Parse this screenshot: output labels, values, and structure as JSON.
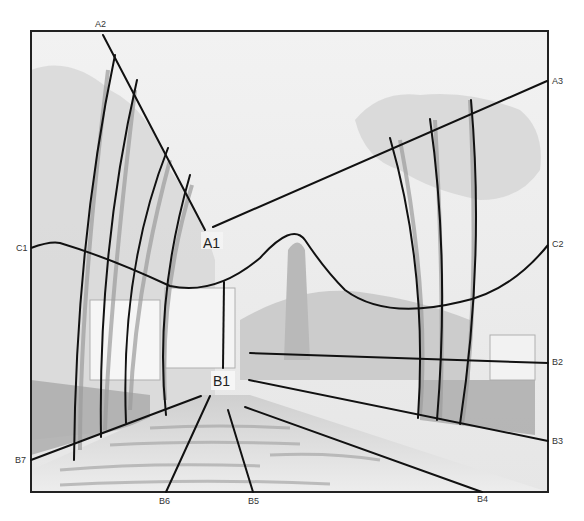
{
  "diagram": {
    "colors": {
      "frame": "#222222",
      "guide_line": "#111111",
      "sky": "#ececec",
      "pencil_light": "#d6d6d6",
      "pencil_mid": "#b4b4b4",
      "pencil_dark": "#8c8c8c",
      "road": "#e2e2e2"
    },
    "labels": {
      "A1": "A1",
      "A2": "A2",
      "A3": "A3",
      "B1": "B1",
      "B2": "B2",
      "B3": "B3",
      "B4": "B4",
      "B5": "B5",
      "B6": "B6",
      "B7": "B7",
      "C1": "C1",
      "C2": "C2"
    },
    "groups": {
      "A": "Tree-crown convergence lines meeting at A1",
      "B": "Ground-plane perspective lines converging at vanishing point B1",
      "C": "Curved skyline contour from C1 to C2"
    }
  }
}
